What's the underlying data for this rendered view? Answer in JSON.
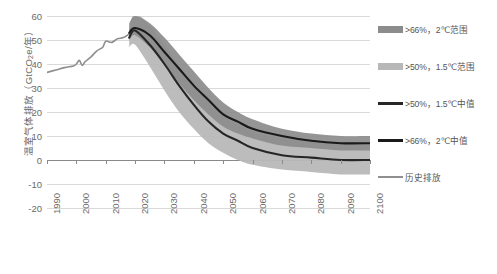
{
  "chart_data": {
    "type": "area",
    "title": "",
    "xlabel": "",
    "ylabel": "温室气体排放（GtCO2e/年）",
    "ylabel_prefix": "温室气体排放（GtCO",
    "ylabel_sub": "2",
    "ylabel_suffix": "e/年）",
    "xlim": [
      1990,
      2100
    ],
    "ylim": [
      -20,
      60
    ],
    "ytick_labels": [
      "60",
      "50",
      "40",
      "30",
      "20",
      "10",
      "0",
      "-10",
      "-20"
    ],
    "ytick_values": [
      60,
      50,
      40,
      30,
      20,
      10,
      0,
      -10,
      -20
    ],
    "xtick_labels": [
      "1990",
      "2000",
      "2010",
      "2020",
      "2030",
      "2040",
      "2050",
      "2060",
      "2070",
      "2080",
      "2090",
      "2100"
    ],
    "xtick_values": [
      1990,
      2000,
      2010,
      2020,
      2030,
      2040,
      2050,
      2060,
      2070,
      2080,
      2090,
      2100
    ],
    "grid": true,
    "legend_position": "right",
    "series": [
      {
        "name": ">66%，2°C范围",
        "type": "band",
        "color": "#8c8c8c",
        "x": [
          2018,
          2020,
          2025,
          2030,
          2035,
          2040,
          2045,
          2050,
          2055,
          2060,
          2070,
          2080,
          2090,
          2100
        ],
        "upper": [
          57,
          60,
          57,
          51,
          44,
          37,
          30,
          24,
          20,
          17,
          13,
          11,
          10,
          10
        ],
        "lower": [
          50,
          52,
          47,
          40,
          32,
          25,
          19,
          14,
          11,
          9,
          6,
          5,
          4,
          4
        ]
      },
      {
        "name": ">50%，1.5°C范围",
        "type": "band",
        "color": "#b8b8b8",
        "x": [
          2018,
          2020,
          2025,
          2030,
          2035,
          2040,
          2045,
          2050,
          2055,
          2060,
          2070,
          2080,
          2090,
          2100
        ],
        "upper": [
          55,
          61,
          56,
          48,
          39,
          31,
          24,
          18,
          15,
          12,
          9,
          8,
          7,
          7
        ],
        "lower": [
          47,
          48,
          39,
          29,
          20,
          13,
          7,
          3,
          0,
          -2,
          -4,
          -5,
          -6,
          -6
        ]
      },
      {
        "name": ">50%，1.5°C中值",
        "type": "line",
        "color": "#262626",
        "x": [
          2018,
          2020,
          2025,
          2030,
          2035,
          2040,
          2045,
          2050,
          2055,
          2060,
          2070,
          2080,
          2090,
          2100
        ],
        "values": [
          51,
          54,
          48,
          40,
          31,
          23,
          16,
          11,
          8,
          5,
          2,
          1,
          0,
          0
        ]
      },
      {
        "name": ">66%，2°C中值",
        "type": "line",
        "color": "#1a1a1a",
        "x": [
          2018,
          2020,
          2025,
          2030,
          2035,
          2040,
          2045,
          2050,
          2055,
          2060,
          2070,
          2080,
          2090,
          2100
        ],
        "values": [
          53,
          55,
          52,
          45,
          38,
          31,
          25,
          19,
          16,
          13,
          10,
          8,
          7,
          7
        ]
      },
      {
        "name": "历史排放",
        "type": "line",
        "color": "#8f8f8f",
        "x": [
          1990,
          1993,
          1996,
          1999,
          2000,
          2001,
          2002,
          2003,
          2005,
          2007,
          2009,
          2010,
          2012,
          2014,
          2016,
          2018,
          2019
        ],
        "values": [
          36.5,
          37.5,
          38.5,
          39.2,
          40.0,
          41.5,
          39.4,
          41.0,
          43.0,
          45.5,
          47.0,
          49.5,
          49.0,
          50.5,
          51.0,
          52.5,
          53.2
        ]
      }
    ]
  },
  "legend": {
    "items": [
      {
        "label": ">66%，2℃范围",
        "swatch": "band",
        "color": "#8c8c8c"
      },
      {
        "label": ">50%，1.5℃范围",
        "swatch": "band",
        "color": "#b8b8b8"
      },
      {
        "label": ">50%，1.5℃中值",
        "swatch": "line",
        "color": "#262626"
      },
      {
        "label": ">66%，2℃中值",
        "swatch": "line",
        "color": "#1a1a1a"
      },
      {
        "label": "历史排放",
        "swatch": "line-thin",
        "color": "#8f8f8f"
      }
    ]
  },
  "colors": {
    "band_2c": "#8c8c8c",
    "band_15c": "#b8b8b8",
    "median_15c": "#262626",
    "median_2c": "#1a1a1a",
    "historical": "#8f8f8f",
    "grid": "#d9d9d9",
    "axis": "#8a8a8a",
    "text": "#6b6b6b"
  }
}
